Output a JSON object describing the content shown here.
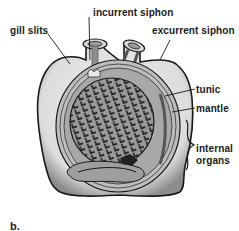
{
  "figure": {
    "panel_label": "b.",
    "labels": {
      "incurrent_siphon": "incurrent siphon",
      "excurrent_siphon": "excurrent siphon",
      "gill_slits": "gill slits",
      "tunic": "tunic",
      "mantle": "mantle",
      "internal_organs_line1": "internal",
      "internal_organs_line2": "organs"
    },
    "colors": {
      "outline": "#1a1a1a",
      "tunic_fill": "#e4e4e4",
      "mantle_fill": "#bdbdbd",
      "pharynx_fill": "#8a8a8a",
      "background": "#ffffff"
    }
  }
}
